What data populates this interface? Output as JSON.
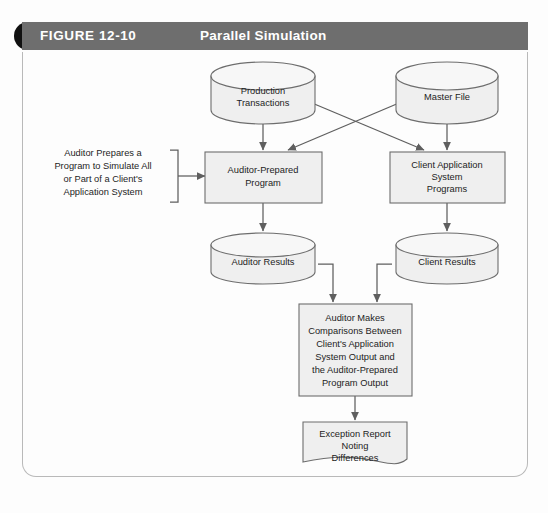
{
  "header": {
    "figure_number": "FIGURE 12-10",
    "title": "Parallel Simulation",
    "tab_color": "#111111",
    "band_color": "#6e6e6e",
    "title_color": "#ffffff"
  },
  "palette": {
    "shape_fill": "#efefef",
    "shape_stroke": "#6d6d6d",
    "connector": "#5f5f5f",
    "page_border": "#b9b9b9",
    "page_background": "#fdfdfd",
    "text": "#1d1d1d"
  },
  "diagram": {
    "type": "flowchart",
    "nodes": [
      {
        "id": "production-transactions",
        "shape": "cylinder",
        "lines": [
          "Production",
          "Transactions"
        ]
      },
      {
        "id": "master-file",
        "shape": "cylinder",
        "lines": [
          "Master File"
        ]
      },
      {
        "id": "auditor-prepared-program",
        "shape": "process",
        "lines": [
          "Auditor-Prepared",
          "Program"
        ]
      },
      {
        "id": "client-application-system-programs",
        "shape": "process",
        "lines": [
          "Client Application",
          "System",
          "Programs"
        ]
      },
      {
        "id": "auditor-results",
        "shape": "cylinder",
        "lines": [
          "Auditor Results"
        ]
      },
      {
        "id": "client-results",
        "shape": "cylinder",
        "lines": [
          "Client Results"
        ]
      },
      {
        "id": "auditor-makes-comparisons",
        "shape": "process",
        "lines": [
          "Auditor Makes",
          "Comparisons Between",
          "Client's Application",
          "System Output and",
          "the Auditor-Prepared",
          "Program Output"
        ]
      },
      {
        "id": "exception-report",
        "shape": "document",
        "lines": [
          "Exception Report",
          "Noting",
          "Differences"
        ]
      }
    ],
    "annotation": {
      "id": "auditor-note",
      "lines": [
        "Auditor Prepares a",
        "Program to Simulate All",
        "or Part of a Client's",
        "Application System"
      ]
    },
    "edges": [
      {
        "from": "production-transactions",
        "to": "auditor-prepared-program",
        "style": "straight"
      },
      {
        "from": "production-transactions",
        "to": "client-application-system-programs",
        "style": "diagonal"
      },
      {
        "from": "master-file",
        "to": "client-application-system-programs",
        "style": "straight"
      },
      {
        "from": "master-file",
        "to": "auditor-prepared-program",
        "style": "diagonal"
      },
      {
        "from": "auditor-prepared-program",
        "to": "auditor-results",
        "style": "straight"
      },
      {
        "from": "client-application-system-programs",
        "to": "client-results",
        "style": "straight"
      },
      {
        "from": "auditor-results",
        "to": "auditor-makes-comparisons",
        "style": "elbow"
      },
      {
        "from": "client-results",
        "to": "auditor-makes-comparisons",
        "style": "elbow"
      },
      {
        "from": "auditor-makes-comparisons",
        "to": "exception-report",
        "style": "straight"
      },
      {
        "from": "auditor-note",
        "to": "auditor-prepared-program",
        "style": "bracket"
      }
    ]
  }
}
